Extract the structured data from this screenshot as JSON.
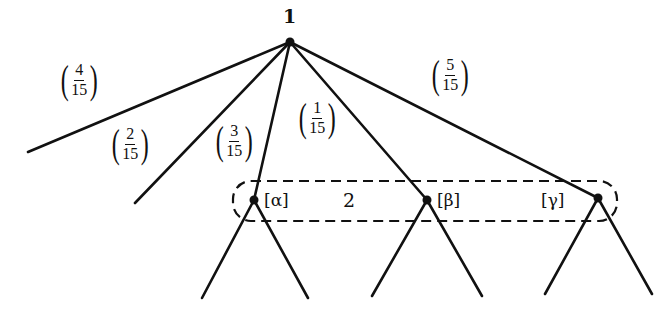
{
  "diagram": {
    "type": "extensive-form game tree",
    "root": {
      "player_label": "1",
      "x": 290,
      "y": 42
    },
    "nature_edges": [
      {
        "prob_num": "4",
        "prob_den": "15",
        "to": "terminal",
        "end": [
          28,
          152
        ]
      },
      {
        "prob_num": "2",
        "prob_den": "15",
        "to": "terminal",
        "end": [
          135,
          203
        ]
      },
      {
        "prob_num": "3",
        "prob_den": "15",
        "to": "alpha",
        "end": [
          254,
          200
        ]
      },
      {
        "prob_num": "1",
        "prob_den": "15",
        "to": "beta",
        "end": [
          427,
          200
        ]
      },
      {
        "prob_num": "5",
        "prob_den": "15",
        "to": "gamma",
        "end": [
          598,
          198
        ]
      }
    ],
    "information_set": {
      "player_label": "2",
      "nodes": [
        {
          "id": "alpha",
          "belief_label": "[α]",
          "x": 254,
          "y": 200,
          "children": [
            [
              202,
              298
            ],
            [
              308,
              298
            ]
          ]
        },
        {
          "id": "beta",
          "belief_label": "[β]",
          "x": 427,
          "y": 200,
          "children": [
            [
              372,
              296
            ],
            [
              482,
              296
            ]
          ]
        },
        {
          "id": "gamma",
          "belief_label": "[γ]",
          "x": 598,
          "y": 198,
          "children": [
            [
              545,
              294
            ],
            [
              652,
              294
            ]
          ]
        }
      ]
    }
  }
}
